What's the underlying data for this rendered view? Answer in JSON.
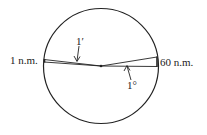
{
  "diagram": {
    "labels": {
      "left": "1 n.m.",
      "right": "60 n.m.",
      "arc_minute": "1′",
      "degree": "1°"
    },
    "colors": {
      "stroke": "#222222",
      "background": "#ffffff"
    }
  }
}
